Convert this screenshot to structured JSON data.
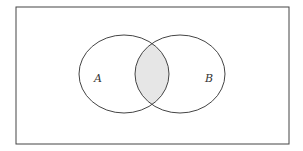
{
  "diagram": {
    "type": "venn",
    "universe": {
      "x": 16,
      "y": 7,
      "width": 273,
      "height": 137
    },
    "sets": [
      {
        "label": "A",
        "cx": 124,
        "cy": 74,
        "rx": 45,
        "ry": 39,
        "label_x": 94,
        "label_y": 82
      },
      {
        "label": "B",
        "cx": 180,
        "cy": 74,
        "rx": 45,
        "ry": 39,
        "label_x": 205,
        "label_y": 82
      }
    ],
    "shaded_region": "A ∩ B",
    "colors": {
      "stroke": "#444444",
      "shade": "#e6e6e6",
      "background": "#ffffff"
    }
  }
}
